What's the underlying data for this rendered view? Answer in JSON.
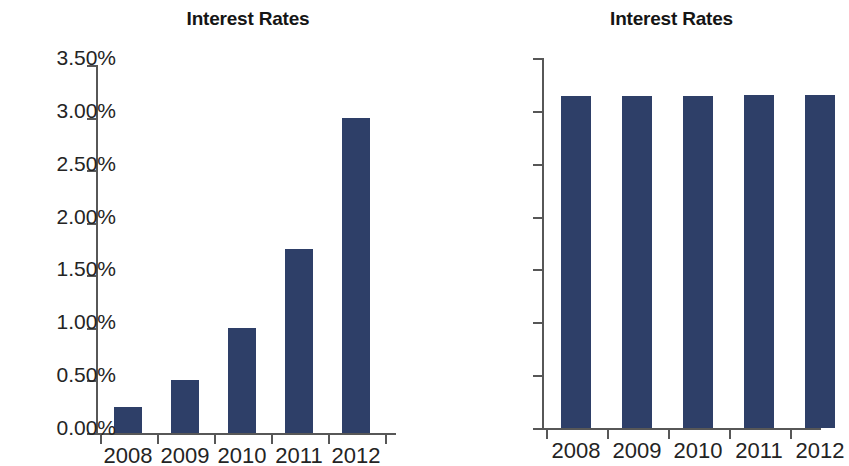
{
  "chart_data": [
    {
      "id": "left",
      "type": "bar",
      "title": "Interest Rates",
      "xlabel": "",
      "ylabel": "",
      "categories": [
        "2008",
        "2009",
        "2010",
        "2011",
        "2012"
      ],
      "values": [
        3.141,
        3.142,
        3.144,
        3.147,
        3.152
      ],
      "value_unit": "%",
      "ylim": [
        3.14,
        3.154
      ],
      "ytick_values": [
        3.154,
        3.152,
        3.15,
        3.148,
        3.146,
        3.144,
        3.142,
        3.14
      ],
      "yticklabels": [
        "3.154%",
        "3.152%",
        "3.150%",
        "3.148%",
        "3.146%",
        "3.144%",
        "3.142%",
        "3.140%"
      ],
      "xticklabels": [
        "2008",
        "2009",
        "2010",
        "2011",
        "2012"
      ],
      "grid": false,
      "legend": null,
      "bar_color": "#2e3f68",
      "axis_color": "#575757"
    },
    {
      "id": "right",
      "type": "bar",
      "title": "Interest Rates",
      "xlabel": "",
      "ylabel": "",
      "categories": [
        "2008",
        "2009",
        "2010",
        "2011",
        "2012"
      ],
      "values": [
        3.141,
        3.142,
        3.144,
        3.147,
        3.152
      ],
      "value_unit": "%",
      "ylim": [
        0.0,
        3.5
      ],
      "ytick_values": [
        3.5,
        3.0,
        2.5,
        2.0,
        1.5,
        1.0,
        0.5,
        0.0
      ],
      "yticklabels": [
        "3.50%",
        "3.00%",
        "2.50%",
        "2.00%",
        "1.50%",
        "1.00%",
        "0.50%",
        "0.00%"
      ],
      "xticklabels": [
        "2008",
        "2009",
        "2010",
        "2011",
        "2012"
      ],
      "grid": false,
      "legend": null,
      "bar_color": "#2e3f68",
      "axis_color": "#575757"
    }
  ],
  "left": {
    "title": "Interest Rates",
    "yticklabels": [
      "3.154%",
      "3.152%",
      "3.150%",
      "3.148%",
      "3.146%",
      "3.144%",
      "3.142%",
      "3.140%"
    ],
    "xticklabels": [
      "2008",
      "2009",
      "2010",
      "2011",
      "2012"
    ]
  },
  "right": {
    "title": "Interest Rates",
    "yticklabels": [
      "3.50%",
      "3.00%",
      "2.50%",
      "2.00%",
      "1.50%",
      "1.00%",
      "0.50%",
      "0.00%"
    ],
    "xticklabels": [
      "2008",
      "2009",
      "2010",
      "2011",
      "2012"
    ]
  }
}
